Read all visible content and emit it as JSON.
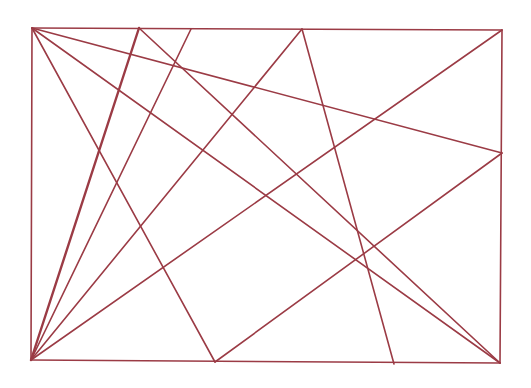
{
  "diagram": {
    "title": "",
    "stroke_color": "#9b3b45",
    "background": "#ffffff",
    "points": {
      "TL": [
        32,
        28
      ],
      "TR": [
        502,
        30
      ],
      "BR": [
        500,
        363
      ],
      "BL": [
        31,
        360
      ],
      "A": [
        139,
        28
      ],
      "B": [
        191,
        29
      ],
      "C": [
        302,
        29
      ],
      "D": [
        215,
        362
      ],
      "E": [
        394,
        364
      ],
      "R": [
        502,
        153
      ]
    },
    "segments": [
      {
        "id": "frame-top",
        "from": "TL",
        "to": "TR",
        "width": 1.6
      },
      {
        "id": "frame-right",
        "from": "TR",
        "to": "BR",
        "width": 1.6
      },
      {
        "id": "frame-bottom",
        "from": "BL",
        "to": "BR",
        "width": 1.6
      },
      {
        "id": "frame-left",
        "from": "TL",
        "to": "BL",
        "width": 1.6
      },
      {
        "id": "tl-to-r",
        "from": "TL",
        "to": "R",
        "width": 1.6
      },
      {
        "id": "tl-to-br",
        "from": "TL",
        "to": "BR",
        "width": 1.6
      },
      {
        "id": "tl-to-d",
        "from": "TL",
        "to": "D",
        "width": 1.6
      },
      {
        "id": "a-to-br",
        "from": "A",
        "to": "BR",
        "width": 1.6
      },
      {
        "id": "bl-to-a",
        "from": "BL",
        "to": "A",
        "width": 2.4
      },
      {
        "id": "bl-to-b",
        "from": "BL",
        "to": "B",
        "width": 1.6
      },
      {
        "id": "bl-to-c",
        "from": "BL",
        "to": "C",
        "width": 1.6
      },
      {
        "id": "bl-to-tr",
        "from": "BL",
        "to": "TR",
        "width": 1.6
      },
      {
        "id": "c-to-e",
        "from": "C",
        "to": "E",
        "width": 1.6
      },
      {
        "id": "d-to-r",
        "from": "D",
        "to": "R",
        "width": 1.6
      }
    ]
  }
}
